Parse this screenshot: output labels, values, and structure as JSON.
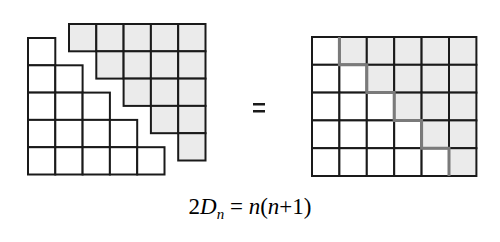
{
  "figure": {
    "n": 5,
    "left_staircase": {
      "rows": 5,
      "fill": "#ffffff",
      "label": "D_n (white)"
    },
    "right_staircase": {
      "rows": 5,
      "fill": "#ebebeb",
      "label": "D_n (grey)"
    },
    "combined_rectangle": {
      "rows": 5,
      "cols": 6
    },
    "equals_symbol": "=",
    "colors": {
      "stroke": "#1a1a1a",
      "grey_fill": "#ebebeb",
      "staircase_edge": "#7a7a7a"
    }
  },
  "formula": {
    "coef": "2",
    "var": "D",
    "sub": "n",
    "rhs_eq": " = ",
    "rhs_n": "n",
    "rhs_paren": "(",
    "rhs_n2": "n",
    "rhs_plus": "+1)"
  }
}
